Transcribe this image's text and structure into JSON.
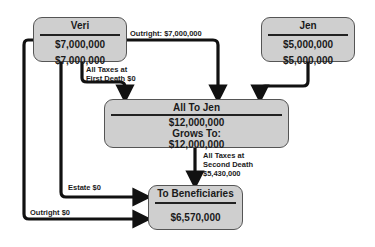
{
  "nodes": {
    "veri": {
      "title": "Veri",
      "value1": "$7,000,000",
      "value2": "$7,000,000"
    },
    "jen": {
      "title": "Jen",
      "value1": "$5,000,000",
      "value2": "$5,000,000"
    },
    "all_to_jen": {
      "title": "All To Jen",
      "value1": "$12,000,000",
      "grows_label": "Grows To:",
      "value2": "$12,000,000"
    },
    "beneficiaries": {
      "title": "To Beneficiaries",
      "value": "$6,570,000"
    }
  },
  "edges": {
    "veri_outright_to_jen": "Outright:  $7,000,000",
    "first_death_taxes_line1": "All Taxes at",
    "first_death_taxes_line2": "First Death  $0",
    "second_death_taxes_line1": "All Taxes at",
    "second_death_taxes_line2": "Second Death",
    "second_death_taxes_line3": "$5,430,000",
    "estate": "Estate $0",
    "outright_beneficiaries": "Outright  $0"
  },
  "colors": {
    "box_fill": "#cfcfcf",
    "arrow": "#111111",
    "background": "#ffffff"
  }
}
